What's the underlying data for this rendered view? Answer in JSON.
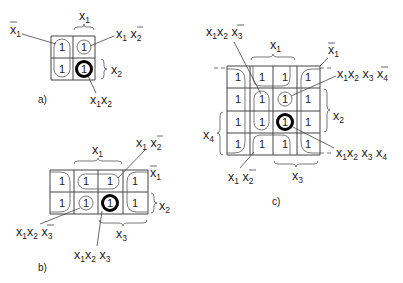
{
  "figure": {
    "panels": [
      {
        "id": "a",
        "caption": "a)",
        "variables": 2,
        "cells": [
          [
            "1",
            "1"
          ],
          [
            "1",
            "1"
          ]
        ],
        "labels": {
          "top_brace": "x1",
          "right_brace": "x2",
          "left_lead": "x̄1",
          "top_right_lead": "x1 x̄2",
          "bottom_lead": "x1x2"
        }
      },
      {
        "id": "b",
        "caption": "b)",
        "variables": 3,
        "cells": [
          [
            "1",
            "1",
            "1",
            "1"
          ],
          [
            "1",
            "1",
            "1",
            "1"
          ]
        ],
        "labels": {
          "top_brace": "x1",
          "right_top": "x̄1",
          "right_brace": "x2",
          "bottom_brace": "x3",
          "top_right_lead": "x1 x̄2",
          "bottom_left_lead": "x1x2 x̄3",
          "bottom_lead": "x1x2 x3"
        }
      },
      {
        "id": "c",
        "caption": "c)",
        "variables": 4,
        "cells": [
          [
            "1",
            "1",
            "1",
            "1"
          ],
          [
            "1",
            "1",
            "1",
            "1"
          ],
          [
            "1",
            "1",
            "1",
            "1"
          ],
          [
            "1",
            "1",
            "1",
            "1"
          ]
        ],
        "labels": {
          "top_brace": "x1",
          "top_right": "x̄1",
          "right_brace": "x2",
          "left_brace": "x4",
          "bottom_brace": "x3",
          "top_left_lead": "x1x2 x̄3",
          "right_lead_1": "x1x2 x3 x̄4",
          "right_lead_2": "x1x2 x3 x4",
          "bottom_left_lead": "x1 x̄2"
        }
      }
    ]
  }
}
